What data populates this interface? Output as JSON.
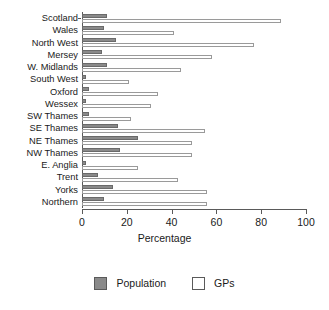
{
  "chart_data": {
    "type": "bar",
    "orientation": "horizontal",
    "title": "",
    "xlabel": "Percentage",
    "ylabel": "",
    "xlim": [
      0,
      100
    ],
    "xticks": [
      0,
      20,
      40,
      60,
      80,
      100
    ],
    "grid": false,
    "legend_position": "bottom",
    "categories": [
      "Scotland",
      "Wales",
      "North West",
      "Mersey",
      "W. Midlands",
      "South West",
      "Oxford",
      "Wessex",
      "SW Thames",
      "SE Thames",
      "NE Thames",
      "NW Thames",
      "E. Anglia",
      "Trent",
      "Yorks",
      "Northern"
    ],
    "series": [
      {
        "name": "Population",
        "color": "#8a8a8a",
        "values": [
          11,
          10,
          15,
          9,
          11,
          2,
          3,
          2,
          3,
          16,
          25,
          17,
          2,
          7,
          14,
          10
        ]
      },
      {
        "name": "GPs",
        "color": "#ffffff",
        "values": [
          89,
          41,
          77,
          58,
          44,
          21,
          34,
          31,
          22,
          55,
          49,
          49,
          25,
          43,
          56,
          56
        ]
      }
    ]
  },
  "legend": {
    "items": [
      {
        "label": "Population",
        "swatch": "filled-gray-square"
      },
      {
        "label": "GPs",
        "swatch": "outlined-white-square"
      }
    ]
  },
  "colors": {
    "population_fill": "#8a8a8a",
    "population_stroke": "#6a6a6a",
    "gps_fill": "#ffffff",
    "gps_stroke": "#9a9a9a",
    "axis": "#5a5a5a",
    "text": "#1a1a1a",
    "background": "#ffffff"
  }
}
